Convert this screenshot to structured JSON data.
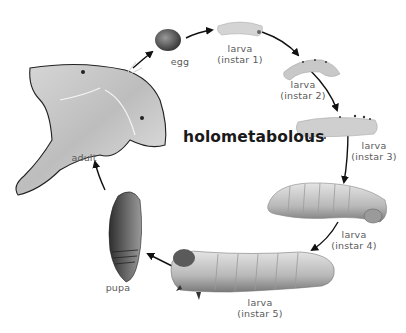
{
  "diagram": {
    "title": "holometabolous",
    "colors": {
      "background": "#ffffff",
      "arrow": "#111111",
      "label": "#5a5a5a",
      "title": "#1a1a1a"
    },
    "stages": [
      {
        "id": "egg",
        "label": "egg"
      },
      {
        "id": "larva-1",
        "label_line1": "larva",
        "label_line2": "(instar 1)"
      },
      {
        "id": "larva-2",
        "label_line1": "larva",
        "label_line2": "(instar 2)"
      },
      {
        "id": "larva-3",
        "label_line1": "larva",
        "label_line2": "(instar 3)"
      },
      {
        "id": "larva-4",
        "label_line1": "larva",
        "label_line2": "(instar 4)"
      },
      {
        "id": "larva-5",
        "label_line1": "larva",
        "label_line2": "(instar 5)"
      },
      {
        "id": "pupa",
        "label": "pupa"
      },
      {
        "id": "adult",
        "label": "adult"
      }
    ],
    "cycle_order": [
      "egg",
      "larva (instar 1)",
      "larva (instar 2)",
      "larva (instar 3)",
      "larva (instar 4)",
      "larva (instar 5)",
      "pupa",
      "adult"
    ]
  }
}
